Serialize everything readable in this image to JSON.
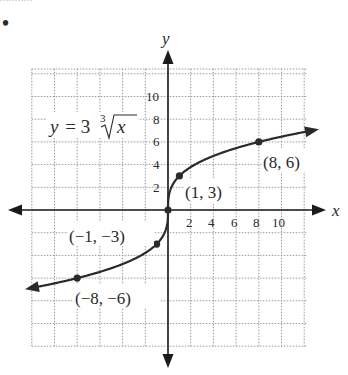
{
  "bullet": "•",
  "chart_data": {
    "type": "line",
    "title": "",
    "equation": {
      "lhs": "y",
      "equals": "=",
      "coefficient": "3",
      "root_index": "3",
      "radicand": "x"
    },
    "xlabel": "x",
    "ylabel": "y",
    "xlim": [
      -12,
      12
    ],
    "ylim": [
      -12,
      12
    ],
    "grid": true,
    "grid_step": 2,
    "x_ticks": [
      "2",
      "4",
      "6",
      "8",
      "10"
    ],
    "y_ticks": [
      "2",
      "4",
      "6",
      "8",
      "10"
    ],
    "function": "y = 3 * cbrt(x)",
    "series": [
      {
        "name": "y = 3∛x",
        "x": [
          -12,
          -8,
          -1,
          0,
          1,
          8,
          12
        ],
        "y": [
          -6.87,
          -6,
          -3,
          0,
          3,
          6,
          6.87
        ]
      }
    ],
    "labeled_points": [
      {
        "x": 8,
        "y": 6,
        "label": "(8, 6)"
      },
      {
        "x": 1,
        "y": 3,
        "label": "(1, 3)"
      },
      {
        "x": 0,
        "y": 0,
        "label": ""
      },
      {
        "x": -1,
        "y": -3,
        "label": "(−1, −3)"
      },
      {
        "x": -8,
        "y": -6,
        "label": "(−8, −6)"
      }
    ],
    "colors": {
      "curve": "#2a2a2a",
      "axes": "#1a1a1a",
      "grid": "#9a9a9a"
    }
  }
}
